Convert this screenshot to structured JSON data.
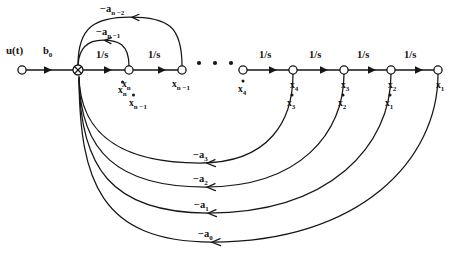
{
  "diagram": {
    "type": "signal-flow-graph",
    "colors": {
      "background": "#ffffff",
      "stroke": "#161616",
      "text": "#141414"
    },
    "input": {
      "source_label": "u(t)",
      "input_gain_label": "b",
      "input_gain_sub": "0"
    },
    "integrator_gain_label": "1/s",
    "ellipsis": "• • •",
    "forward_path": {
      "gains": [
        "1/s",
        "1/s",
        "1/s",
        "1/s",
        "1/s",
        "1/s"
      ],
      "node_labels": [
        {
          "base": "x",
          "sub": "n"
        },
        {
          "base": "x",
          "sub": "n −1"
        },
        {
          "base": "x",
          "sub": "4"
        },
        {
          "base": "x",
          "sub": "3"
        },
        {
          "base": "x",
          "sub": "2"
        },
        {
          "base": "x",
          "sub": "1"
        }
      ],
      "derivative_labels": [
        {
          "base": "x",
          "sub": "n"
        },
        {
          "base": "x",
          "sub": "n −1"
        },
        {
          "base": "x",
          "sub": "4"
        },
        {
          "base": "x",
          "sub": "3"
        },
        {
          "base": "x",
          "sub": "2"
        },
        {
          "base": "x",
          "sub": "1"
        }
      ]
    },
    "feedback_upper": [
      {
        "prefix": "−",
        "base": "a",
        "sub": "n −1"
      },
      {
        "prefix": "−",
        "base": "a",
        "sub": "n −2"
      }
    ],
    "feedback_lower": [
      {
        "prefix": "−",
        "base": "a",
        "sub": "3"
      },
      {
        "prefix": "−",
        "base": "a",
        "sub": "2"
      },
      {
        "prefix": "−",
        "base": "a",
        "sub": "1"
      },
      {
        "prefix": "−",
        "base": "a",
        "sub": "0"
      }
    ]
  }
}
